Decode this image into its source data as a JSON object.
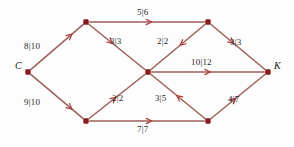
{
  "figure": {
    "background_color": "#fdfdfd",
    "edge_color": "#9c5f58",
    "arrow_color": "#b03a3a",
    "node_color": "#8e1b1b",
    "label_color": "#2a2a2a",
    "width": 294,
    "height": 147
  },
  "chart_data": {
    "type": "diagram",
    "subtype": "flow-network",
    "label_format": "flow|capacity",
    "nodes": [
      {
        "id": "C",
        "label": "C",
        "x": 28,
        "y": 72,
        "label_dx": -13,
        "label_dy": -6,
        "role": "source"
      },
      {
        "id": "TL",
        "label": "",
        "x": 86,
        "y": 22,
        "label_dx": 0,
        "label_dy": 0,
        "role": "intermediate"
      },
      {
        "id": "BL",
        "label": "",
        "x": 86,
        "y": 121,
        "label_dx": 0,
        "label_dy": 0,
        "role": "intermediate"
      },
      {
        "id": "M",
        "label": "",
        "x": 148,
        "y": 72,
        "label_dx": 0,
        "label_dy": 0,
        "role": "intermediate"
      },
      {
        "id": "TR",
        "label": "",
        "x": 208,
        "y": 22,
        "label_dx": 0,
        "label_dy": 0,
        "role": "intermediate"
      },
      {
        "id": "BR",
        "label": "",
        "x": 208,
        "y": 121,
        "label_dx": 0,
        "label_dy": 0,
        "role": "intermediate"
      },
      {
        "id": "K",
        "label": "K",
        "x": 268,
        "y": 72,
        "label_dx": 6,
        "label_dy": -6,
        "role": "sink"
      }
    ],
    "edges": [
      {
        "from": "C",
        "to": "TL",
        "flow": 8,
        "capacity": 10,
        "label": "8|10",
        "label_x": 24,
        "label_y": 41,
        "arrow_t": 0.78
      },
      {
        "from": "C",
        "to": "BL",
        "flow": 9,
        "capacity": 10,
        "label": "9|10",
        "label_x": 24,
        "label_y": 97,
        "arrow_t": 0.78
      },
      {
        "from": "TL",
        "to": "TR",
        "flow": 5,
        "capacity": 6,
        "label": "5|6",
        "label_x": 137,
        "label_y": 7,
        "arrow_t": 0.54
      },
      {
        "from": "TL",
        "to": "M",
        "flow": 3,
        "capacity": 3,
        "label": "3|3",
        "label_x": 110,
        "label_y": 36,
        "arrow_t": 0.42
      },
      {
        "from": "TR",
        "to": "M",
        "flow": 2,
        "capacity": 2,
        "label": "2|2",
        "label_x": 157,
        "label_y": 36,
        "arrow_t": 0.46
      },
      {
        "from": "TR",
        "to": "K",
        "flow": 3,
        "capacity": 3,
        "label": "3|3",
        "label_x": 230,
        "label_y": 37,
        "arrow_t": 0.42
      },
      {
        "from": "M",
        "to": "K",
        "flow": 10,
        "capacity": 12,
        "label": "10|12",
        "label_x": 191,
        "label_y": 57,
        "arrow_t": 0.52
      },
      {
        "from": "BL",
        "to": "M",
        "flow": 2,
        "capacity": 2,
        "label": "2|2",
        "label_x": 112,
        "label_y": 93,
        "arrow_t": 0.48
      },
      {
        "from": "BL",
        "to": "BR",
        "flow": 7,
        "capacity": 7,
        "label": "7|7",
        "label_x": 137,
        "label_y": 124,
        "arrow_t": 0.54
      },
      {
        "from": "BR",
        "to": "M",
        "flow": 3,
        "capacity": 5,
        "label": "3|5",
        "label_x": 155,
        "label_y": 93,
        "arrow_t": 0.52
      },
      {
        "from": "BR",
        "to": "K",
        "flow": 4,
        "capacity": 7,
        "label": "4|7",
        "label_x": 228,
        "label_y": 94,
        "arrow_t": 0.46
      }
    ]
  }
}
